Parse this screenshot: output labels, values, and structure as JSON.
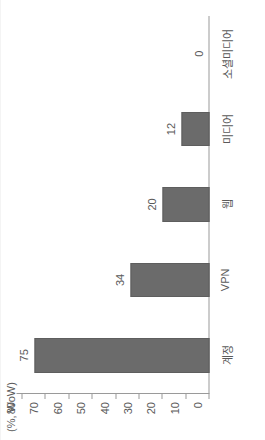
{
  "chart_data": {
    "type": "bar",
    "orientation": "horizontal-rotated",
    "title": "",
    "subtitle": "",
    "xlabel": "",
    "ylabel": "(%, WoW)",
    "axis_title": "(%, WoW)",
    "categories": [
      "계정",
      "VPN",
      "웹",
      "미디어",
      "소셜미디어"
    ],
    "values": [
      75,
      34,
      20,
      12,
      0
    ],
    "value_labels": [
      "75",
      "34",
      "20",
      "12",
      "0"
    ],
    "ylim": [
      0,
      80
    ],
    "ticks": [
      80,
      70,
      60,
      50,
      40,
      30,
      20,
      10,
      0
    ],
    "tick_labels": [
      "80",
      "70",
      "60",
      "50",
      "40",
      "30",
      "20",
      "10",
      "0"
    ],
    "grid": false,
    "legend": null,
    "series": [
      {
        "name": "",
        "values": [
          75,
          34,
          20,
          12,
          0
        ]
      }
    ],
    "colors": {
      "bar_fill": "#6b6b6b",
      "bar_stroke": "#5e5e5e",
      "axis": "#9a9a9a",
      "text": "#5a5a5a",
      "background": "#ffffff"
    }
  }
}
